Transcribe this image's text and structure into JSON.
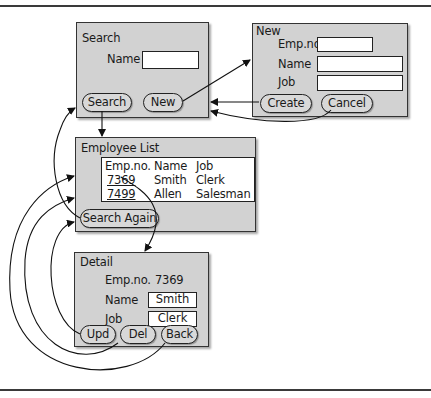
{
  "search_window": {
    "title": "Search",
    "name_label": "Name",
    "name_value": "",
    "search_button": "Search",
    "new_button": "New"
  },
  "new_window": {
    "title": "New",
    "empno_label": "Emp.no.",
    "name_label": "Name",
    "job_label": "Job",
    "empno_value": "",
    "name_value": "",
    "job_value": "",
    "create_button": "Create",
    "cancel_button": "Cancel"
  },
  "employee_list_window": {
    "title": "Employee List",
    "columns": [
      "Emp.no.",
      "Name",
      "Job"
    ],
    "rows": [
      {
        "empno": "7369",
        "name": "Smith",
        "job": "Clerk"
      },
      {
        "empno": "7499",
        "name": "Allen",
        "job": "Salesman"
      }
    ],
    "search_again_button": "Search Again"
  },
  "detail_window": {
    "title": "Detail",
    "empno_label": "Emp.no.",
    "empno_value": "7369",
    "name_label": "Name",
    "name_value": "Smith",
    "job_label": "Job",
    "job_value": "Clerk",
    "upd_button": "Upd",
    "del_button": "Del",
    "back_button": "Back"
  },
  "transitions": [
    {
      "from": "Search",
      "to": "Employee List"
    },
    {
      "from": "New",
      "to": "New window"
    },
    {
      "from": "Create",
      "to": "Search window"
    },
    {
      "from": "Cancel",
      "to": "Search window"
    },
    {
      "from": "Search Again",
      "to": "Search window"
    },
    {
      "from": "7369",
      "to": "Detail window"
    },
    {
      "from": "Upd",
      "to": "Employee List"
    },
    {
      "from": "Del",
      "to": "Employee List"
    },
    {
      "from": "Back",
      "to": "Employee List"
    }
  ]
}
